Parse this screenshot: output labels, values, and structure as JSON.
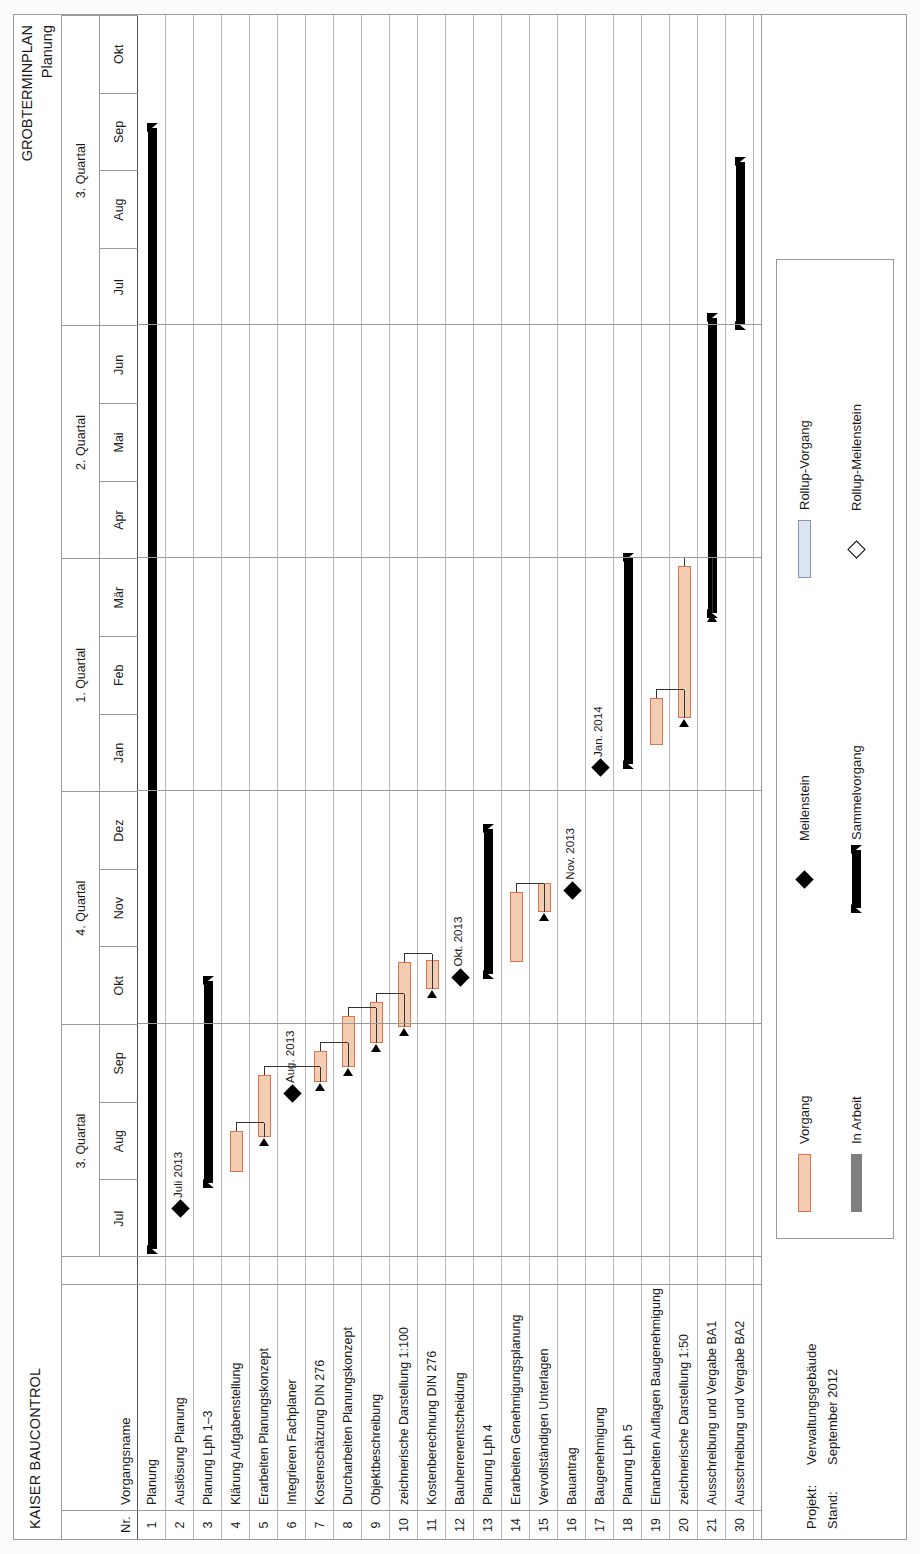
{
  "header": {
    "company": "KAISER BAUCONTROL",
    "title_line1": "GROBTERMINPLAN",
    "title_line2": "Planung"
  },
  "table": {
    "col_nr": "Nr.",
    "col_name": "Vorgangsname"
  },
  "timeline": {
    "quarters": [
      {
        "label": "3. Quartal",
        "months": 3
      },
      {
        "label": "4. Quartal",
        "months": 3
      },
      {
        "label": "1. Quartal",
        "months": 3
      },
      {
        "label": "2. Quartal",
        "months": 3
      },
      {
        "label": "3. Quartal",
        "months": 4
      }
    ],
    "months": [
      "Jul",
      "Aug",
      "Sep",
      "Okt",
      "Nov",
      "Dez",
      "Jan",
      "Feb",
      "Mär",
      "Apr",
      "Mai",
      "Jun",
      "Jul",
      "Aug",
      "Sep",
      "Okt"
    ]
  },
  "rows": [
    {
      "nr": "1",
      "name": "Planung",
      "type": "summary",
      "start": 0.1,
      "end": 14.55
    },
    {
      "nr": "2",
      "name": "Auslösung Planung",
      "type": "milestone",
      "at": 0.62,
      "label": "Juli 2013"
    },
    {
      "nr": "3",
      "name": "Planung Lph 1–3",
      "type": "summary",
      "start": 0.95,
      "end": 3.55
    },
    {
      "nr": "4",
      "name": "Klärung Aufgabenstellung",
      "type": "task",
      "start": 1.1,
      "end": 1.62
    },
    {
      "nr": "5",
      "name": "Erarbeiten Planungskonzept",
      "type": "task",
      "start": 1.55,
      "end": 2.35
    },
    {
      "nr": "6",
      "name": "Integrieren Fachplaner",
      "type": "milestone",
      "at": 2.1,
      "label": "Aug. 2013"
    },
    {
      "nr": "7",
      "name": "Kostenschätzung DIN 276",
      "type": "task",
      "start": 2.25,
      "end": 2.66
    },
    {
      "nr": "8",
      "name": "Durcharbeiten Planungskonzept",
      "type": "task",
      "start": 2.45,
      "end": 3.1
    },
    {
      "nr": "9",
      "name": "Objektbeschreibung",
      "type": "task",
      "start": 2.76,
      "end": 3.28
    },
    {
      "nr": "10",
      "name": "zeichnerische Darstellung 1:100",
      "type": "task",
      "start": 2.96,
      "end": 3.8
    },
    {
      "nr": "11",
      "name": "Kostenberechnung DIN 276",
      "type": "task",
      "start": 3.45,
      "end": 3.82
    },
    {
      "nr": "12",
      "name": "Bauherrenentscheidung",
      "type": "milestone",
      "at": 3.6,
      "label": "Okt. 2013"
    },
    {
      "nr": "13",
      "name": "Planung Lph 4",
      "type": "summary",
      "start": 3.65,
      "end": 5.52
    },
    {
      "nr": "14",
      "name": "Erarbeiten Genehmigungsplanung",
      "type": "task",
      "start": 3.8,
      "end": 4.7
    },
    {
      "nr": "15",
      "name": "Vervollständigen Unterlagen",
      "type": "task",
      "start": 4.45,
      "end": 4.82
    },
    {
      "nr": "16",
      "name": "Bauantrag",
      "type": "milestone",
      "at": 4.72,
      "label": "Nov. 2013"
    },
    {
      "nr": "17",
      "name": "Baugenehmigung",
      "type": "milestone",
      "at": 6.3,
      "label": "Jan. 2014"
    },
    {
      "nr": "18",
      "name": "Planung Lph 5",
      "type": "summary",
      "start": 6.35,
      "end": 9.0
    },
    {
      "nr": "19",
      "name": "Einarbeiten Auflagen Baugenehmigung",
      "type": "task",
      "start": 6.6,
      "end": 7.2
    },
    {
      "nr": "20",
      "name": "zeichnerische Darstellung 1:50",
      "type": "task",
      "start": 6.95,
      "end": 8.9
    },
    {
      "nr": "21",
      "name": "Ausschreibung und Vergabe BA1",
      "type": "summary",
      "start": 8.3,
      "end": 12.1
    },
    {
      "nr": "30",
      "name": "Ausschreibung und Vergabe BA2",
      "type": "summary",
      "start": 12.0,
      "end": 14.1
    }
  ],
  "legend": [
    {
      "key": "vorgang",
      "label": "Vorgang"
    },
    {
      "key": "in-arbeit",
      "label": "In Arbeit"
    },
    {
      "key": "meilenstein",
      "label": "Meilenstein"
    },
    {
      "key": "sammelvorgang",
      "label": "Sammelvorgang"
    },
    {
      "key": "rollup-vorgang",
      "label": "Rollup-Vorgang"
    },
    {
      "key": "rollup-meilenstein",
      "label": "Rollup-Meilenstein"
    }
  ],
  "footer": {
    "projekt_key": "Projekt:",
    "projekt_val": "Verwaltungsgebäude",
    "stand_key": "Stand:",
    "stand_val": "September 2012"
  },
  "colors": {
    "task_fill": "#f3cdb1",
    "task_border": "#e1714c",
    "summary": "#000000",
    "in_arbeit": "#7f7f7f",
    "rollup_fill": "#dbe5f1",
    "rollup_border": "#8497b0",
    "grid": "#9a9a9a"
  }
}
